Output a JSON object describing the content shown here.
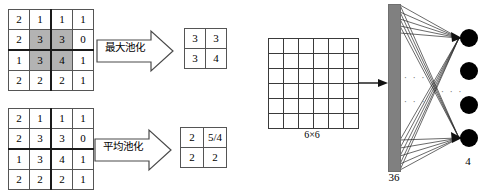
{
  "figure": {
    "colors": {
      "shade": "#b3b3b3",
      "bar": "#808080",
      "node": "#000000",
      "line": "#3a3a3a"
    }
  },
  "max_pool": {
    "source_matrix": {
      "rows": 4,
      "cols": 4,
      "values": [
        [
          "2",
          "1",
          "1",
          "1"
        ],
        [
          "2",
          "3",
          "3",
          "0"
        ],
        [
          "1",
          "3",
          "4",
          "1"
        ],
        [
          "2",
          "2",
          "2",
          "1"
        ]
      ],
      "shaded_cells": [
        [
          1,
          1
        ],
        [
          1,
          2
        ],
        [
          2,
          1
        ],
        [
          2,
          2
        ]
      ]
    },
    "operation_label": "最大池化",
    "result_matrix": {
      "rows": 2,
      "cols": 2,
      "values": [
        [
          "3",
          "3"
        ],
        [
          "3",
          "4"
        ]
      ]
    }
  },
  "avg_pool": {
    "source_matrix": {
      "rows": 4,
      "cols": 4,
      "values": [
        [
          "2",
          "1",
          "1",
          "1"
        ],
        [
          "2",
          "3",
          "3",
          "0"
        ],
        [
          "1",
          "3",
          "4",
          "1"
        ],
        [
          "2",
          "2",
          "2",
          "1"
        ]
      ],
      "shaded_cells": []
    },
    "operation_label": "平均池化",
    "result_matrix": {
      "rows": 2,
      "cols": 2,
      "values": [
        [
          "2",
          "5/4"
        ],
        [
          "2",
          "2"
        ]
      ]
    }
  },
  "feature_map": {
    "rows": 6,
    "cols": 6,
    "label": "6×6"
  },
  "network": {
    "input_units_label": "36",
    "output_units_label": "4",
    "output_node_count": 4,
    "ellipsis_input_1": "· · ·",
    "ellipsis_input_2": "· · ·",
    "ellipsis_output": "· · ·"
  }
}
